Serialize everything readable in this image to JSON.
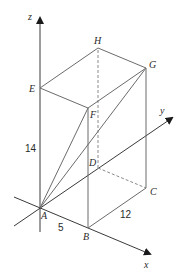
{
  "diagram": {
    "title": "",
    "type": "3d-cuboid-coordinate-diagram",
    "axes": {
      "x": {
        "label": "x"
      },
      "y": {
        "label": "y"
      },
      "z": {
        "label": "z"
      }
    },
    "vertices": {
      "A": {
        "label": "A"
      },
      "B": {
        "label": "B"
      },
      "C": {
        "label": "C"
      },
      "D": {
        "label": "D"
      },
      "E": {
        "label": "E"
      },
      "F": {
        "label": "F"
      },
      "G": {
        "label": "G"
      },
      "H": {
        "label": "H"
      }
    },
    "dimensions": {
      "AB": "5",
      "BC": "12",
      "AE": "14"
    },
    "edges_solid": [
      "AB",
      "BC",
      "AE",
      "BF",
      "CG",
      "EF",
      "FG",
      "EH",
      "HG",
      "AG",
      "AF"
    ],
    "edges_dashed": [
      "DH",
      "DC"
    ],
    "colors": {
      "edge": "#6b6b6b",
      "axis": "#3a3a3a",
      "label": "#2a2a2a",
      "background": "#ffffff"
    }
  }
}
